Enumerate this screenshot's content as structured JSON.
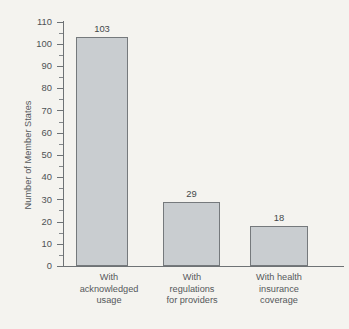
{
  "chart_data": {
    "type": "bar",
    "title": "",
    "subtitle": "",
    "xlabel": "",
    "ylabel": "Number of Member States",
    "ylim": [
      0,
      110
    ],
    "ytick_step": 10,
    "yminor_step": 5,
    "grid": false,
    "legend": null,
    "orientation": "vertical",
    "bar_color": "#c9cdd0",
    "bar_border_color": "#75797c",
    "background_color": "#f4f3ef",
    "categories": [
      "With acknowledged usage",
      "With regulations for providers",
      "With health insurance coverage"
    ],
    "category_lines": [
      [
        "With",
        "acknowledged",
        "usage"
      ],
      [
        "With",
        "regulations",
        "for providers"
      ],
      [
        "With health",
        "insurance",
        "coverage"
      ]
    ],
    "values": [
      103,
      29,
      18
    ],
    "value_labels": [
      "103",
      "29",
      "18"
    ],
    "ytick_labels": [
      "0",
      "10",
      "20",
      "30",
      "40",
      "50",
      "60",
      "70",
      "80",
      "90",
      "100",
      "110"
    ],
    "ytick_values": [
      0,
      10,
      20,
      30,
      40,
      50,
      60,
      70,
      80,
      90,
      100,
      110
    ]
  }
}
